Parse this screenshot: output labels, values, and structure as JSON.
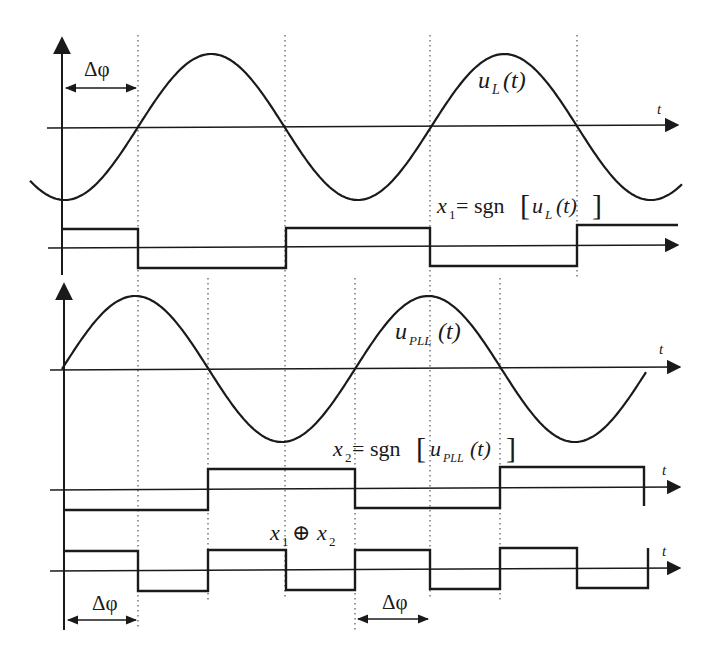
{
  "diagram": {
    "colors": {
      "ink": "#1a1a1a",
      "dotted": "#555555",
      "background": "#ffffff"
    },
    "signals": [
      {
        "id": "uL",
        "name": "u_L(t)",
        "type": "sine",
        "label_main": "u",
        "label_sub": "L",
        "label_arg": "(t)"
      },
      {
        "id": "x1",
        "name": "x1 = sgn[u_L(t)]",
        "type": "square",
        "label_var": "x",
        "label_var_sub": "1",
        "label_eq": " = sgn",
        "label_inner": "u",
        "label_inner_sub": "L",
        "label_arg": "(t)"
      },
      {
        "id": "uPLL",
        "name": "u_PLL(t)",
        "type": "sine",
        "label_main": "u",
        "label_sub": "PLL",
        "label_arg": "(t)"
      },
      {
        "id": "x2",
        "name": "x2 = sgn[u_PLL(t)]",
        "type": "square",
        "label_var": "x",
        "label_var_sub": "2",
        "label_eq": " = sgn",
        "label_inner": "u",
        "label_inner_sub": "PLL",
        "label_arg": "(t)"
      },
      {
        "id": "xor",
        "name": "x1 ⊕ x2",
        "type": "square",
        "label_a": "x",
        "label_a_sub": "1",
        "label_op": "⊕",
        "label_b": "x",
        "label_b_sub": "2"
      }
    ],
    "axis_label": "t",
    "phase_label": "Δφ",
    "annotations": [
      {
        "text": "Δφ",
        "position": "top-left",
        "between": "axis-start to first uL zero crossing"
      },
      {
        "text": "Δφ",
        "position": "bottom-left",
        "between": "axis-start to first xor transition"
      },
      {
        "text": "Δφ",
        "position": "bottom-center",
        "between": "x2 rising edge to x1 falling edge"
      }
    ]
  },
  "chart_data": {
    "type": "line",
    "xlabel": "t",
    "ylabel": "",
    "series": [
      {
        "name": "u_L(t)",
        "kind": "sine",
        "phase_lag": "Δφ",
        "zero_crossings_x": [
          138,
          285,
          430,
          577
        ]
      },
      {
        "name": "x1 = sgn[u_L(t)]",
        "kind": "square",
        "transitions_x": [
          138,
          286,
          430,
          577
        ],
        "initial": "high"
      },
      {
        "name": "u_PLL(t)",
        "kind": "sine",
        "zero_crossings_x": [
          62,
          208,
          355,
          500,
          645
        ]
      },
      {
        "name": "x2 = sgn[u_PLL(t)]",
        "kind": "square",
        "transitions_x": [
          208,
          355,
          500,
          645
        ],
        "initial": "low"
      },
      {
        "name": "x1 ⊕ x2",
        "kind": "square",
        "transitions_x": [
          138,
          208,
          286,
          355,
          430,
          500,
          577,
          648
        ],
        "initial": "high"
      }
    ],
    "grid": "dotted vertical guide lines at transitions",
    "legend": "none (inline labels)"
  }
}
